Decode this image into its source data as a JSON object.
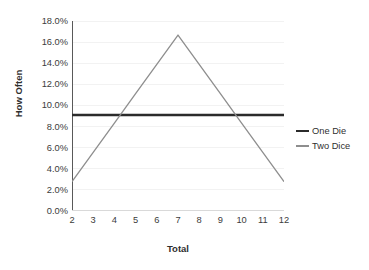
{
  "chart_data": {
    "type": "line",
    "title": "",
    "xlabel": "Total",
    "ylabel": "How Often",
    "x": [
      2,
      3,
      4,
      5,
      6,
      7,
      8,
      9,
      10,
      11,
      12
    ],
    "xlim": [
      2,
      12
    ],
    "ylim": [
      0,
      18
    ],
    "grid": "horizontal-faint",
    "legend_position": "right",
    "y_ticks": [
      "0.0%",
      "2.0%",
      "4.0%",
      "6.0%",
      "8.0%",
      "10.0%",
      "12.0%",
      "14.0%",
      "16.0%",
      "18.0%"
    ],
    "y_tick_values": [
      0,
      2,
      4,
      6,
      8,
      10,
      12,
      14,
      16,
      18
    ],
    "x_ticks": [
      "2",
      "3",
      "4",
      "5",
      "6",
      "7",
      "8",
      "9",
      "10",
      "11",
      "12"
    ],
    "series": [
      {
        "name": "One Die",
        "color": "#2b2b2b",
        "width": 2.6,
        "values": [
          9.09,
          9.09,
          9.09,
          9.09,
          9.09,
          9.09,
          9.09,
          9.09,
          9.09,
          9.09,
          9.09
        ]
      },
      {
        "name": "Two Dice",
        "color": "#8e8e8e",
        "width": 1.3,
        "values": [
          2.78,
          5.56,
          8.33,
          11.11,
          13.89,
          16.67,
          13.89,
          11.11,
          8.33,
          5.56,
          2.78
        ]
      }
    ]
  },
  "axes": {
    "y_title": "How Often",
    "x_title": "Total"
  },
  "legend": {
    "items": [
      {
        "label": "One Die",
        "swatch": "one-die"
      },
      {
        "label": "Two Dice",
        "swatch": "two-dice"
      }
    ]
  },
  "colors": {
    "axis": "#595959",
    "grid": "#f2f2f2",
    "text": "#3b3b3b",
    "one_die": "#2b2b2b",
    "two_dice": "#8e8e8e",
    "background": "#ffffff"
  }
}
